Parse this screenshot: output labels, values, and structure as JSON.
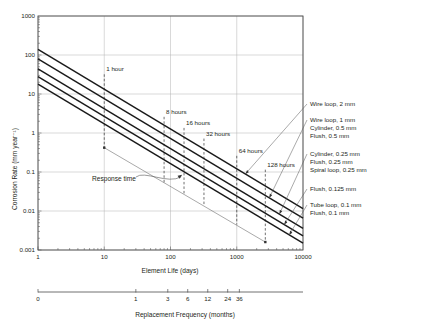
{
  "chart_data": {
    "type": "line",
    "title": "",
    "xlabel": "Element Life (days)",
    "ylabel": "Corrosion Rate (mm year⁻¹)",
    "xscale": "log",
    "yscale": "log",
    "xlim": [
      1,
      10000
    ],
    "ylim": [
      0.001,
      1000
    ],
    "grid": true,
    "legend_position": "right-outside",
    "xticks": [
      "1",
      "10",
      "100",
      "1000",
      "10000"
    ],
    "yticks": [
      "1000",
      "100",
      "10",
      "1",
      "0.1",
      "0.01",
      "0.001"
    ],
    "series": [
      {
        "name": "Wire loop, 2 mm",
        "points": [
          [
            1,
            140
          ],
          [
            10000,
            0.0115
          ]
        ]
      },
      {
        "name": "Wire loop, 1 mm\nCylinder, 0.5 mm\nFlush, 0.5 mm",
        "points": [
          [
            1,
            80
          ],
          [
            10000,
            0.0066
          ]
        ]
      },
      {
        "name": "Cylinder, 0.25 mm\nFlush, 0.25 mm\nSpiral loop, 0.25 mm",
        "points": [
          [
            1,
            44
          ],
          [
            10000,
            0.0036
          ]
        ]
      },
      {
        "name": "Flush, 0.125 mm",
        "points": [
          [
            1,
            28
          ],
          [
            10000,
            0.0023
          ]
        ]
      },
      {
        "name": "Tube loop, 0.1 mm\nFlush, 0.1 mm",
        "points": [
          [
            1,
            18
          ],
          [
            10000,
            0.0015
          ]
        ]
      }
    ],
    "response_time_line": {
      "name": "Response time",
      "points": [
        [
          10,
          0.42
        ],
        [
          2700,
          0.0016
        ]
      ]
    },
    "annotations": [
      {
        "text": "1 hour",
        "x": 10,
        "y_top": 32,
        "y_bottom": 0.42
      },
      {
        "text": "8 hours",
        "x": 80,
        "y_top": 2.6,
        "y_bottom": 0.052
      },
      {
        "text": "16 hours",
        "x": 160,
        "y_top": 1.35,
        "y_bottom": 0.027
      },
      {
        "text": "32 hours",
        "x": 320,
        "y_top": 0.72,
        "y_bottom": 0.014
      },
      {
        "text": "64 hours",
        "x": 1000,
        "y_top": 0.26,
        "y_bottom": 0.0045
      },
      {
        "text": "128 hours",
        "x": 2700,
        "y_top": 0.115,
        "y_bottom": 0.0016
      }
    ],
    "response_time_label": "Response time",
    "secondary_axis": {
      "label": "Replacement Frequency (months)",
      "ticks": [
        {
          "label": "0",
          "days": 1
        },
        {
          "label": "1",
          "days": 30
        },
        {
          "label": "3",
          "days": 91
        },
        {
          "label": "6",
          "days": 182
        },
        {
          "label": "12",
          "days": 365
        },
        {
          "label": "24",
          "days": 730
        },
        {
          "label": "36",
          "days": 1095
        }
      ]
    },
    "series_labels": [
      "Wire loop, 2 mm",
      "Wire loop, 1 mm",
      "Cylinder, 0.5 mm",
      "Flush, 0.5 mm",
      "Cylinder, 0.25 mm",
      "Flush, 0.25 mm",
      "Spiral loop, 0.25 mm",
      "Flush, 0.125 mm",
      "Tube loop, 0.1 mm",
      "Flush, 0.1 mm"
    ],
    "colors": {
      "line": "#1a1a1a",
      "grid": "#b3b3b3",
      "axis": "#4d4d4d",
      "text": "#231f20",
      "response": "#6e6e6e"
    }
  },
  "caption": ""
}
